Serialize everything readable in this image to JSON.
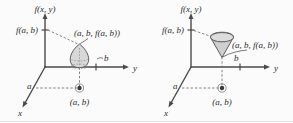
{
  "figure": {
    "background_color": "#fbfbfb",
    "ink_color": "#2b2b2b",
    "surface_fill": "#d6d6d6",
    "panels": [
      {
        "id": "left",
        "name": "paraboloid-peak-panel",
        "surface_shape": "teardrop-dome",
        "labels": {
          "vertical_axis": "f(x, y)",
          "vertical_value": "f(a, b)",
          "point_3d": "(a, b, f(a, b))",
          "y_axis": "y",
          "x_axis": "x",
          "b_marker": "b",
          "a_marker": "a",
          "base_point": "(a, b)"
        }
      },
      {
        "id": "right",
        "name": "cone-panel",
        "surface_shape": "inverted-cone",
        "labels": {
          "vertical_axis": "f(x, y)",
          "vertical_value": "f(a, b)",
          "point_3d": "(a, b, f(a, b))",
          "y_axis": "y",
          "x_axis": "x",
          "b_marker": "b",
          "a_marker": "a",
          "base_point": "(a, b)"
        }
      }
    ]
  }
}
